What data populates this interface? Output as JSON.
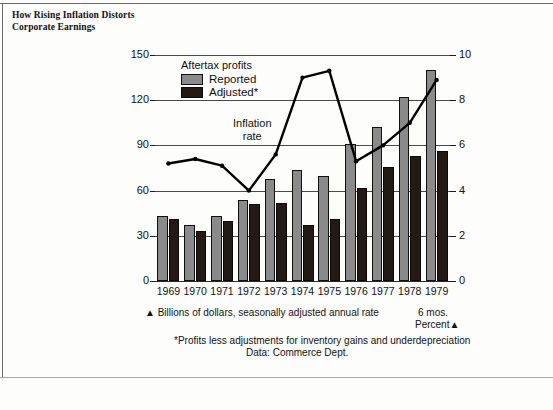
{
  "title": "How Rising Inflation Distorts Corporate Earnings",
  "legend": {
    "heading": "Aftertax profits",
    "items": [
      {
        "label": "Reported",
        "color": "#8a8a8a",
        "name": "reported"
      },
      {
        "label": "Adjusted*",
        "color": "#231a16",
        "name": "adjusted"
      }
    ]
  },
  "annotations": {
    "inflation_line1": "Inflation",
    "inflation_line2": "rate"
  },
  "footnotes": {
    "left_axis_note": "▲ Billions of dollars, seasonally adjusted annual rate",
    "last_period": "6 mos.",
    "right_axis_note": "Percent▲",
    "asterisk": "*Profits less adjustments for inventory gains and underdepreciation",
    "source": "Data: Commerce Dept."
  },
  "chart_data": {
    "type": "bar",
    "title": "How Rising Inflation Distorts Corporate Earnings",
    "xlabel": "",
    "ylabel": "Billions of dollars, seasonally adjusted annual rate",
    "y2label": "Percent",
    "ylim": [
      0,
      150
    ],
    "y2lim": [
      0,
      10
    ],
    "yticks": [
      0,
      30,
      60,
      90,
      120,
      150
    ],
    "y2ticks": [
      0,
      2,
      4,
      6,
      8,
      10
    ],
    "grid": true,
    "legend_position": "top-left",
    "categories": [
      "1969",
      "1970",
      "1971",
      "1972",
      "1973",
      "1974",
      "1975",
      "1976",
      "1977",
      "1978",
      "1979"
    ],
    "last_category_note": "6 mos.",
    "series": [
      {
        "name": "Reported",
        "type": "bar",
        "axis": "left",
        "color": "#8a8a8a",
        "values": [
          43,
          37,
          43,
          54,
          68,
          74,
          70,
          91,
          102,
          122,
          140
        ]
      },
      {
        "name": "Adjusted*",
        "type": "bar",
        "axis": "left",
        "color": "#231a16",
        "values": [
          41,
          33,
          40,
          51,
          52,
          37,
          41,
          62,
          76,
          83,
          86
        ]
      },
      {
        "name": "Inflation rate",
        "type": "line",
        "axis": "right",
        "color": "#000000",
        "values": [
          5.2,
          5.4,
          5.1,
          4.0,
          5.6,
          9.0,
          9.3,
          5.3,
          6.0,
          7.0,
          8.9
        ]
      }
    ]
  }
}
